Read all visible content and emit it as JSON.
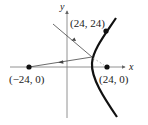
{
  "diagram": {
    "type": "hyperbola-reflection",
    "axes": {
      "x_label": "x",
      "y_label": "y"
    },
    "points": [
      {
        "label": "(24, 24)",
        "role": "point-on-hyperbola"
      },
      {
        "label": "(−24, 0)",
        "role": "left-focus"
      },
      {
        "label": "(24, 0)",
        "role": "right-focus"
      }
    ],
    "colors": {
      "ink": "#111111",
      "axis": "#666666"
    }
  }
}
